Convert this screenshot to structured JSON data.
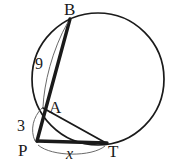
{
  "figure": {
    "type": "circle-secant-tangent-geometry-diagram",
    "background_color": "#ffffff",
    "stroke_color": "#1a1a1a",
    "thin_stroke_color": "#555555",
    "width": 176,
    "height": 164
  },
  "circle": {
    "name": "main-circle",
    "center_x": 98,
    "center_y": 79,
    "radius": 66,
    "stroke_width": 1.6
  },
  "points": {
    "B": {
      "label": "B",
      "x": 70,
      "y": 19,
      "label_x": 64,
      "label_y": 1
    },
    "A": {
      "label": "A",
      "x": 43,
      "y": 108,
      "label_x": 49,
      "label_y": 100
    },
    "P": {
      "label": "P",
      "x": 37,
      "y": 141,
      "label_x": 18,
      "label_y": 142
    },
    "T": {
      "label": "T",
      "x": 106,
      "y": 143,
      "label_x": 108,
      "label_y": 144
    }
  },
  "segments": [
    {
      "name": "secant-PB",
      "from": "P",
      "to": "B",
      "stroke_width": 3.2,
      "label": ""
    },
    {
      "name": "tangent-PT",
      "from": "P",
      "to": "T",
      "stroke_width": 3.2,
      "label": ""
    },
    {
      "name": "chord-AT",
      "from": "A",
      "to": "T",
      "stroke_width": 1.8,
      "label": ""
    }
  ],
  "measurements": [
    {
      "name": "measure-AB",
      "value": "9",
      "label_x": 35,
      "label_y": 56,
      "italic": false,
      "describes": "segment AB length"
    },
    {
      "name": "measure-PA",
      "value": "3",
      "label_x": 17,
      "label_y": 118,
      "italic": false,
      "describes": "segment PA length"
    },
    {
      "name": "measure-PT",
      "value": "x",
      "label_x": 66,
      "label_y": 146,
      "italic": true,
      "describes": "segment PT length, unknown"
    }
  ],
  "measure_arcs": [
    {
      "name": "arc-marker-AB",
      "describes": "thin arc bracket from B to A for the 9 measurement"
    },
    {
      "name": "arc-marker-PA",
      "describes": "thin arc bracket from A to P for the 3 measurement"
    },
    {
      "name": "arc-marker-PT",
      "describes": "thin arc bracket from P to T below the tangent for the x measurement"
    }
  ]
}
